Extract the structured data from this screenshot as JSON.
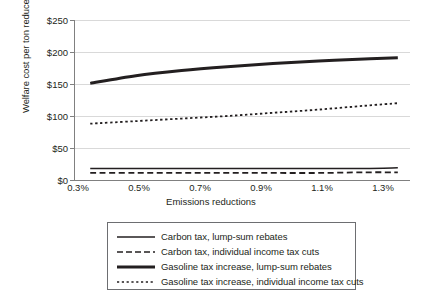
{
  "chart_data": {
    "type": "line",
    "title": "",
    "xlabel": "Emissions reductions",
    "ylabel": "Welfare cost per ton reduced",
    "xlim": [
      0.3,
      1.4
    ],
    "ylim": [
      0,
      250
    ],
    "xticks": [
      "0.3%",
      "0.5%",
      "0.7%",
      "0.9%",
      "1.1%",
      "1.3%"
    ],
    "xtick_values": [
      0.3,
      0.5,
      0.7,
      0.9,
      1.1,
      1.3
    ],
    "yticks": [
      "$0",
      "$50",
      "$100",
      "$150",
      "$200",
      "$250"
    ],
    "ytick_values": [
      0,
      50,
      100,
      150,
      200,
      250
    ],
    "grid": "horizontal",
    "legend_position": "below",
    "x": [
      0.35,
      0.5,
      0.65,
      0.8,
      0.95,
      1.1,
      1.25,
      1.36
    ],
    "series": [
      {
        "name": "Carbon tax, lump-sum rebates",
        "style": "solid-thin",
        "values": [
          18,
          18,
          18,
          18,
          18,
          18,
          18,
          19
        ]
      },
      {
        "name": "Carbon tax, individual income tax cuts",
        "style": "dashed",
        "values": [
          11,
          11,
          11,
          11,
          11,
          11,
          12,
          12
        ]
      },
      {
        "name": "Gasoline tax increase, lump-sum rebates",
        "style": "solid-thick",
        "values": [
          151,
          163,
          171,
          177,
          182,
          186,
          189,
          191
        ]
      },
      {
        "name": "Gasoline tax increase, individual income tax cuts",
        "style": "dotted",
        "values": [
          88,
          92,
          96,
          100,
          105,
          110,
          116,
          120
        ]
      }
    ],
    "colors": {
      "line": "#231f20",
      "grid": "#d9d9d9",
      "axis": "#808080",
      "background": "#ffffff"
    }
  }
}
